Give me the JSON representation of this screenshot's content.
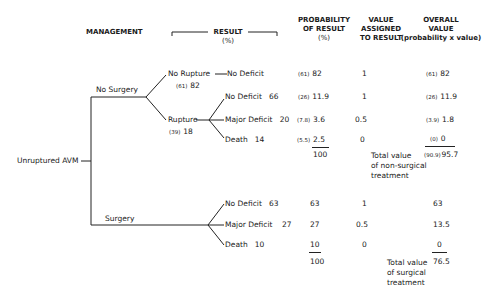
{
  "headers": {
    "management": "MANAGEMENT",
    "result": "RESULT",
    "result_unit": "(%)",
    "probability": [
      "PROBABILITY",
      "OF RESULT",
      "(%)"
    ],
    "value_assigned": [
      "VALUE",
      "ASSIGNED",
      "TO RESULT"
    ],
    "overall": [
      "OVERALL",
      "VALUE",
      "(probability x value)"
    ]
  },
  "root": {
    "label": "Unruptured AVM"
  },
  "no_surgery": {
    "label": "No Surgery",
    "no_rupture": {
      "label": "No Rupture",
      "sub": "(61)",
      "pct": "82"
    },
    "rupture": {
      "label": "Rupture",
      "sub": "(39)",
      "pct": "18"
    },
    "outcomes": [
      {
        "label": "No Deficit",
        "pct": "",
        "prob_sub": "(61)",
        "prob": "82",
        "value": "1",
        "overall_sub": "(61)",
        "overall": "82"
      },
      {
        "label": "No Deficit",
        "pct": "66",
        "prob_sub": "(26)",
        "prob": "11.9",
        "value": "1",
        "overall_sub": "(26)",
        "overall": "11.9"
      },
      {
        "label": "Major Deficit",
        "pct": "20",
        "prob_sub": "(7.8)",
        "prob": "3.6",
        "value": "0.5",
        "overall_sub": "(3.9)",
        "overall": "1.8"
      },
      {
        "label": "Death",
        "pct": "14",
        "prob_sub": "(5.5)",
        "prob": "2.5",
        "value": "0",
        "overall_sub": "(0)",
        "overall": "0"
      }
    ],
    "prob_total": "100",
    "total_label": [
      "Total value",
      "of non-surgical",
      "treatment"
    ],
    "total_sub": "(90.9)",
    "total": "95.7"
  },
  "surgery": {
    "label": "Surgery",
    "outcomes": [
      {
        "label": "No Deficit",
        "pct": "63",
        "prob": "63",
        "value": "1",
        "overall": "63"
      },
      {
        "label": "Major Deficit",
        "pct": "27",
        "prob": "27",
        "value": "0.5",
        "overall": "13.5"
      },
      {
        "label": "Death",
        "pct": "10",
        "prob": "10",
        "value": "0",
        "overall": "0"
      }
    ],
    "prob_total": "100",
    "total_label": [
      "Total value",
      "of surgical",
      "treatment"
    ],
    "total": "76.5"
  }
}
